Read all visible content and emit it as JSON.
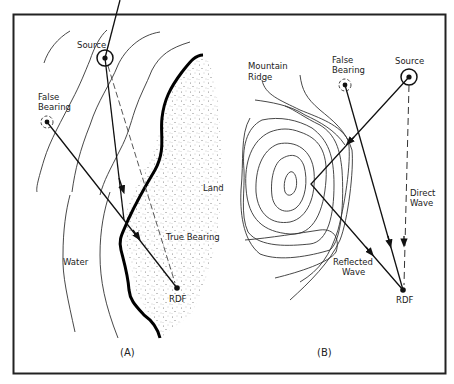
{
  "figure": {
    "panel_a": {
      "caption": "(A)",
      "labels": {
        "source": "Source",
        "false_bearing_1": "False",
        "false_bearing_2": "Bearing",
        "land": "Land",
        "true_bearing": "True Bearing",
        "water": "Water",
        "rdf": "RDF"
      }
    },
    "panel_b": {
      "caption": "(B)",
      "labels": {
        "mountain_1": "Mountain",
        "mountain_2": "Ridge",
        "false_bearing_1": "False",
        "false_bearing_2": "Bearing",
        "source": "Source",
        "direct_1": "Direct",
        "direct_2": "Wave",
        "reflected_1": "Reflected",
        "reflected_2": "Wave",
        "rdf": "RDF"
      }
    },
    "colors": {
      "ink": "#111111",
      "background": "#ffffff"
    }
  }
}
